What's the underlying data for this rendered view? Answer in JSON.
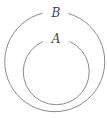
{
  "diagram": {
    "type": "nested-sets",
    "sets": [
      {
        "label": "B",
        "role": "outer"
      },
      {
        "label": "A",
        "role": "inner"
      }
    ],
    "relation": "A is a subset of B",
    "stroke_color": "#8a8a8a",
    "background": "#ffffff"
  }
}
